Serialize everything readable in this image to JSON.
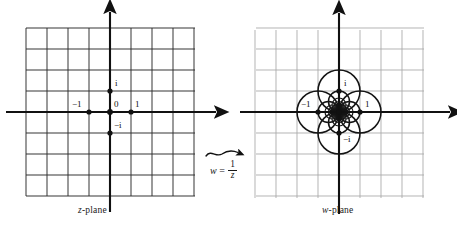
{
  "figure": {
    "background": "#ffffff",
    "ink": "#111111",
    "grid_color_z": "#2b2b2b",
    "grid_color_w": "#a6a6a6",
    "curve_color": "#141414"
  },
  "panels": {
    "left": {
      "caption_italic": "z",
      "caption_rest": "-plane",
      "origin_px": [
        110,
        112
      ],
      "unit_px": 21,
      "grid_cells": 8,
      "grid_bounds_px": [
        26,
        28,
        195,
        196
      ],
      "marked_points": [
        {
          "name": "point-one",
          "label": "1",
          "z": [
            1,
            0
          ],
          "label_dx": 4,
          "label_dy": -13
        },
        {
          "name": "point-minus-one",
          "label": "−1",
          "z": [
            -1,
            0
          ],
          "label_dx": -17,
          "label_dy": -13
        },
        {
          "name": "point-zero",
          "label": "0",
          "z": [
            0,
            0
          ],
          "label_dx": 4,
          "label_dy": -13
        },
        {
          "name": "point-i",
          "label": "i",
          "z": [
            0,
            1
          ],
          "label_dx": 5,
          "label_dy": -13
        },
        {
          "name": "point-minus-i",
          "label": "−i",
          "z": [
            0,
            -1
          ],
          "label_dx": 4,
          "label_dy": -13
        }
      ]
    },
    "right": {
      "caption_italic": "w",
      "caption_rest": "-plane",
      "origin_px": [
        339,
        112
      ],
      "unit_px": 21,
      "grid_cells": 8,
      "grid_bounds_px": [
        256,
        30,
        424,
        198
      ],
      "marked_points": [
        {
          "name": "point-one",
          "label": "1",
          "z": [
            1,
            0
          ],
          "label_dx": 5,
          "label_dy": -13
        },
        {
          "name": "point-minus-one",
          "label": "−1",
          "z": [
            -1,
            0
          ],
          "label_dx": -17,
          "label_dy": -13
        },
        {
          "name": "point-i",
          "label": "i",
          "z": [
            0,
            1
          ],
          "label_dx": 5,
          "label_dy": -13
        },
        {
          "name": "point-minus-i",
          "label": "−i",
          "z": [
            0,
            -1
          ],
          "label_dx": 4,
          "label_dy": 1
        }
      ],
      "image_circles_note": "Images of the square grid lines under w = 1/z: each line x=c maps to a circle of diameter 1/|c| tangent to the imaginary axis at 0; each line y=c maps to a circle of diameter 1/|c| tangent to the real axis at 0.",
      "grid_line_constants": [
        0.5,
        1,
        1.5,
        2,
        2.5,
        3,
        3.5,
        4
      ]
    }
  },
  "transform": {
    "arrow": "wavy-arrow-right",
    "formula_lhs": "w",
    "formula_eq": "=",
    "formula_num": "1",
    "formula_den": "z"
  },
  "chart_data": {
    "type": "scatter",
    "xlabel": "",
    "ylabel": "",
    "annotations": [
      "z-plane",
      "w-plane",
      "w = 1/z"
    ],
    "z_plane": {
      "grid_lines_x": [
        -4,
        -3,
        -2,
        -1,
        0,
        1,
        2,
        3,
        4
      ],
      "grid_lines_y": [
        -4,
        -3,
        -2,
        -1,
        0,
        1,
        2,
        3,
        4
      ],
      "xlim": [
        -4,
        4
      ],
      "ylim": [
        -4,
        4
      ],
      "points": [
        {
          "label": "-1",
          "x": -1,
          "y": 0
        },
        {
          "label": "0",
          "x": 0,
          "y": 0
        },
        {
          "label": "1",
          "x": 1,
          "y": 0
        },
        {
          "label": "i",
          "x": 0,
          "y": 1
        },
        {
          "label": "-i",
          "x": 0,
          "y": -1
        }
      ]
    },
    "w_plane": {
      "xlim": [
        -4,
        4
      ],
      "ylim": [
        -4,
        4
      ],
      "points": [
        {
          "label": "-1",
          "x": -1,
          "y": 0
        },
        {
          "label": "1",
          "x": 1,
          "y": 0
        },
        {
          "label": "i",
          "x": 0,
          "y": 1
        },
        {
          "label": "-i",
          "x": 0,
          "y": -1
        }
      ],
      "circles": [
        {
          "source_line": "x=0.5",
          "center": [
            1,
            0
          ],
          "radius": 1
        },
        {
          "source_line": "x=-0.5",
          "center": [
            -1,
            0
          ],
          "radius": 1
        },
        {
          "source_line": "y=0.5",
          "center": [
            0,
            1
          ],
          "radius": 1
        },
        {
          "source_line": "y=-0.5",
          "center": [
            0,
            -1
          ],
          "radius": 1
        },
        {
          "source_line": "x=1",
          "center": [
            0.5,
            0
          ],
          "radius": 0.5
        },
        {
          "source_line": "x=-1",
          "center": [
            -0.5,
            0
          ],
          "radius": 0.5
        },
        {
          "source_line": "y=1",
          "center": [
            0,
            0.5
          ],
          "radius": 0.5
        },
        {
          "source_line": "y=-1",
          "center": [
            0,
            -0.5
          ],
          "radius": 0.5
        },
        {
          "source_line": "x=1.5",
          "center": [
            0.3333,
            0
          ],
          "radius": 0.3333
        },
        {
          "source_line": "x=-1.5",
          "center": [
            -0.3333,
            0
          ],
          "radius": 0.3333
        },
        {
          "source_line": "y=1.5",
          "center": [
            0,
            0.3333
          ],
          "radius": 0.3333
        },
        {
          "source_line": "y=-1.5",
          "center": [
            0,
            -0.3333
          ],
          "radius": 0.3333
        },
        {
          "source_line": "x=2",
          "center": [
            0.25,
            0
          ],
          "radius": 0.25
        },
        {
          "source_line": "x=-2",
          "center": [
            -0.25,
            0
          ],
          "radius": 0.25
        },
        {
          "source_line": "y=2",
          "center": [
            0,
            0.25
          ],
          "radius": 0.25
        },
        {
          "source_line": "y=-2",
          "center": [
            0,
            -0.25
          ],
          "radius": 0.25
        },
        {
          "source_line": "x=2.5",
          "center": [
            0.2,
            0
          ],
          "radius": 0.2
        },
        {
          "source_line": "x=-2.5",
          "center": [
            -0.2,
            0
          ],
          "radius": 0.2
        },
        {
          "source_line": "y=2.5",
          "center": [
            0,
            0.2
          ],
          "radius": 0.2
        },
        {
          "source_line": "y=-2.5",
          "center": [
            0,
            -0.2
          ],
          "radius": 0.2
        },
        {
          "source_line": "x=3",
          "center": [
            0.1667,
            0
          ],
          "radius": 0.1667
        },
        {
          "source_line": "x=-3",
          "center": [
            -0.1667,
            0
          ],
          "radius": 0.1667
        },
        {
          "source_line": "y=3",
          "center": [
            0,
            0.1667
          ],
          "radius": 0.1667
        },
        {
          "source_line": "y=-3",
          "center": [
            0,
            -0.1667
          ],
          "radius": 0.1667
        },
        {
          "source_line": "x=3.5",
          "center": [
            0.1429,
            0
          ],
          "radius": 0.1429
        },
        {
          "source_line": "x=-3.5",
          "center": [
            -0.1429,
            0
          ],
          "radius": 0.1429
        },
        {
          "source_line": "y=3.5",
          "center": [
            0,
            0.1429
          ],
          "radius": 0.1429
        },
        {
          "source_line": "y=-3.5",
          "center": [
            0,
            -0.1429
          ],
          "radius": 0.1429
        },
        {
          "source_line": "x=4",
          "center": [
            0.125,
            0
          ],
          "radius": 0.125
        },
        {
          "source_line": "x=-4",
          "center": [
            -0.125,
            0
          ],
          "radius": 0.125
        },
        {
          "source_line": "y=4",
          "center": [
            0,
            0.125
          ],
          "radius": 0.125
        },
        {
          "source_line": "y=-4",
          "center": [
            0,
            -0.125
          ],
          "radius": 0.125
        }
      ]
    }
  }
}
